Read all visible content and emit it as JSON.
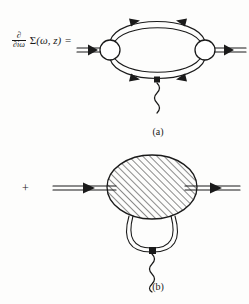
{
  "figure": {
    "background_color": "#fdfdfc",
    "ink_color": "#1a1a1a",
    "equation": {
      "derivative_numerator": "∂",
      "derivative_denominator": "∂iω",
      "function_name": "Σ",
      "function_args": "(ω, z)",
      "equals": "=",
      "plus": "+"
    },
    "panels": [
      {
        "id": "a",
        "label": "(a)",
        "description": "self-energy derivative bubble with two open vertices and wavy boson line"
      },
      {
        "id": "b",
        "label": "(b)",
        "description": "hatched blob with lower double-line loop and wavy boson line"
      }
    ],
    "elements": {
      "vertex_left": "open-circle-vertex",
      "vertex_right": "open-circle-vertex",
      "blob": "hatched-ellipse-blob",
      "boson_line": "wavy-line",
      "fermion_line": "double-line-with-arrow",
      "coupling_dot": "filled-square-dot"
    }
  }
}
